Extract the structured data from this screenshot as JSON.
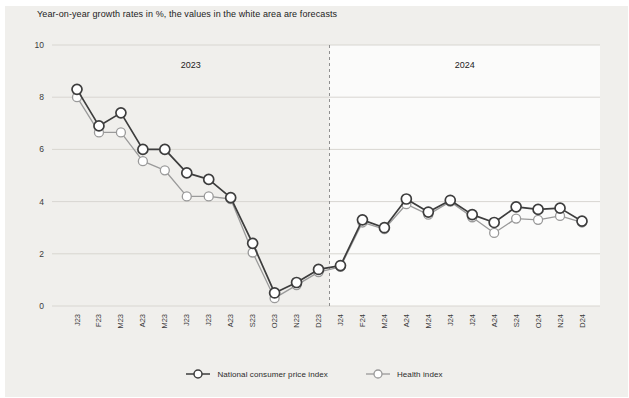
{
  "chart": {
    "title": "Year-on-year growth rates in %, the values in the white area are forecasts"
  },
  "chart_data": {
    "type": "line",
    "title": "Year-on-year growth rates in %, the values in the white area are forecasts",
    "categories": [
      "J23",
      "F23",
      "M23",
      "A23",
      "M23",
      "J23",
      "J23",
      "A23",
      "S23",
      "O23",
      "N23",
      "D23",
      "J24",
      "F24",
      "M24",
      "A24",
      "M24",
      "J24",
      "J24",
      "A24",
      "S24",
      "O24",
      "N24",
      "D24"
    ],
    "series": [
      {
        "id": "ncpi",
        "name": "National consumer price index",
        "color": "#3d3d3d",
        "stroke_width": 1.7,
        "marker_radius": 5,
        "values": [
          8.3,
          6.9,
          7.4,
          6.0,
          6.0,
          5.1,
          4.85,
          4.15,
          2.4,
          0.5,
          0.9,
          1.4,
          1.55,
          3.3,
          3.0,
          4.1,
          3.6,
          4.05,
          3.5,
          3.2,
          3.8,
          3.7,
          3.75,
          3.25
        ]
      },
      {
        "id": "health",
        "name": "Health index",
        "color": "#9a9a9a",
        "stroke_width": 1.3,
        "marker_radius": 4.5,
        "values": [
          8.0,
          6.65,
          6.65,
          5.55,
          5.2,
          4.2,
          4.2,
          4.1,
          2.05,
          0.3,
          0.8,
          1.3,
          1.5,
          3.2,
          2.95,
          3.9,
          3.5,
          4.0,
          3.4,
          2.8,
          3.35,
          3.3,
          3.45,
          3.2
        ]
      }
    ],
    "ylim": [
      0,
      10
    ],
    "yticks": [
      0,
      2,
      4,
      6,
      8,
      10
    ],
    "xlabel": "",
    "ylabel": "",
    "grid": "horizontal",
    "legend_position": "bottom",
    "regions": [
      {
        "label": "2023"
      },
      {
        "label": "2024"
      }
    ],
    "forecast_start_index": 12,
    "colors": {
      "panel_bg": "#f0efec",
      "forecast_bg": "#fbfbfa",
      "gridline": "#d8d6d1",
      "divider": "#8f8f8f",
      "text": "#1c1c1c",
      "tick_text": "#3c3c3c"
    }
  }
}
